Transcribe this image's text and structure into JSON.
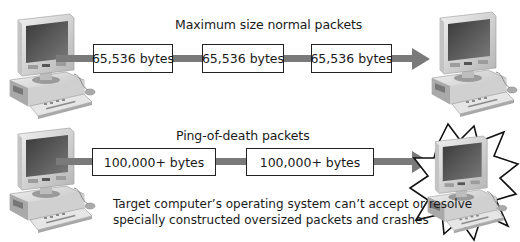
{
  "diagram": {
    "normal": {
      "title": "Maximum size normal packets",
      "packets": [
        {
          "label": "65,536 bytes"
        },
        {
          "label": "65,536 bytes"
        },
        {
          "label": "65,536 bytes"
        }
      ],
      "source": "computer-icon",
      "target": "computer-icon"
    },
    "ping_of_death": {
      "title": "Ping-of-death packets",
      "packets": [
        {
          "label": "100,000+ bytes"
        },
        {
          "label": "100,000+ bytes"
        }
      ],
      "source": "computer-icon",
      "target": "crashed-computer-icon",
      "caption_lines": [
        "Target computer’s operating system can’t accept or resolve",
        "specially constructed oversized packets and crashes"
      ]
    },
    "colors": {
      "line": "#7a7a7a",
      "box_border": "#222222",
      "text": "#1a1a1a"
    }
  }
}
